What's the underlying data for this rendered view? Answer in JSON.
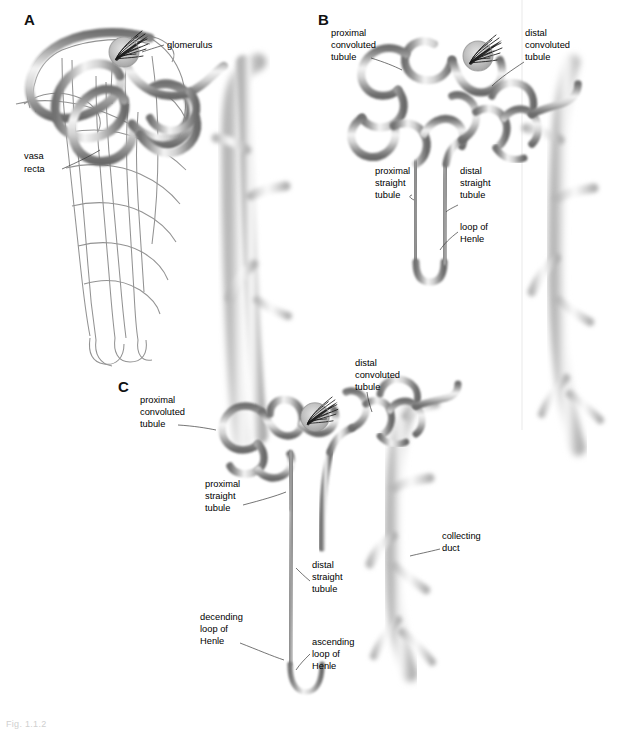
{
  "figure": {
    "background_color": "#ffffff",
    "tubule_color": "#9a9a9a",
    "tubule_highlight": "#f2f2f2",
    "tubule_edge": "#6e6e6e",
    "duct_color": "#c9c9c9",
    "label_color": "#000000",
    "leader_color": "#3a3a3a",
    "caption": "Fig. 1.1.2"
  },
  "panels": [
    {
      "letter": "A",
      "name": "nephron-with-vasa-recta",
      "labels": [
        {
          "id": "glomerulus",
          "text": "glomerulus",
          "lines": [
            "glomerulus"
          ]
        },
        {
          "id": "vasa-recta",
          "text": "vasa recta",
          "lines": [
            "vasa",
            "recta"
          ]
        }
      ]
    },
    {
      "letter": "B",
      "name": "short-looped-nephron",
      "labels": [
        {
          "id": "proximal-convoluted-tubule",
          "text": "proximal convoluted tubule",
          "lines": [
            "proximal",
            "convoluted",
            "tubule"
          ]
        },
        {
          "id": "distal-convoluted-tubule",
          "text": "distal convoluted tubule",
          "lines": [
            "distal",
            "convoluted",
            "tubule"
          ]
        },
        {
          "id": "proximal-straight-tubule",
          "text": "proximal straight tubule",
          "lines": [
            "proximal",
            "straight",
            "tubule"
          ]
        },
        {
          "id": "distal-straight-tubule",
          "text": "distal straight tubule",
          "lines": [
            "distal",
            "straight",
            "tubule"
          ]
        },
        {
          "id": "loop-of-henle",
          "text": "loop of Henle",
          "lines": [
            "loop of",
            "Henle"
          ]
        }
      ]
    },
    {
      "letter": "C",
      "name": "long-looped-nephron",
      "labels": [
        {
          "id": "proximal-convoluted-tubule",
          "text": "proximal convoluted tubule",
          "lines": [
            "proximal",
            "convoluted",
            "tubule"
          ]
        },
        {
          "id": "distal-convoluted-tubule",
          "text": "distal convoluted tubule",
          "lines": [
            "distal",
            "convoluted",
            "tubule"
          ]
        },
        {
          "id": "proximal-straight-tubule",
          "text": "proximal straight tubule",
          "lines": [
            "proximal",
            "straight",
            "tubule"
          ]
        },
        {
          "id": "distal-straight-tubule",
          "text": "distal straight tubule",
          "lines": [
            "distal",
            "straight",
            "tubule"
          ]
        },
        {
          "id": "decending-loop-of-henle",
          "text": "decending loop of Henle",
          "lines": [
            "decending",
            "loop of",
            "Henle"
          ]
        },
        {
          "id": "ascending-loop-of-henle",
          "text": "ascending loop of Henle",
          "lines": [
            "ascending",
            "loop of",
            "Henle"
          ]
        },
        {
          "id": "collecting-duct",
          "text": "collecting duct",
          "lines": [
            "collecting",
            "duct"
          ]
        }
      ]
    }
  ],
  "text": {
    "A": "A",
    "B": "B",
    "C": "C",
    "glomerulus": "glomerulus",
    "vasa_1": "vasa",
    "vasa_2": "recta",
    "b_pct_1": "proximal",
    "b_pct_2": "convoluted",
    "b_pct_3": "tubule",
    "b_dct_1": "distal",
    "b_dct_2": "convoluted",
    "b_dct_3": "tubule",
    "b_pst_1": "proximal",
    "b_pst_2": "straight",
    "b_pst_3": "tubule",
    "b_dst_1": "distal",
    "b_dst_2": "straight",
    "b_dst_3": "tubule",
    "b_loh_1": "loop of",
    "b_loh_2": "Henle",
    "c_pct_1": "proximal",
    "c_pct_2": "convoluted",
    "c_pct_3": "tubule",
    "c_dct_1": "distal",
    "c_dct_2": "convoluted",
    "c_dct_3": "tubule",
    "c_pst_1": "proximal",
    "c_pst_2": "straight",
    "c_pst_3": "tubule",
    "c_dst_1": "distal",
    "c_dst_2": "straight",
    "c_dst_3": "tubule",
    "c_dec_1": "decending",
    "c_dec_2": "loop of",
    "c_dec_3": "Henle",
    "c_asc_1": "ascending",
    "c_asc_2": "loop of",
    "c_asc_3": "Henle",
    "c_cd_1": "collecting",
    "c_cd_2": "duct"
  }
}
